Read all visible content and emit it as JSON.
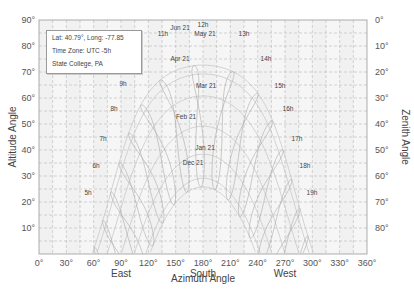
{
  "chart_data": {
    "type": "line",
    "title": "",
    "xlabel": "Azimuth Angle",
    "ylabel": "Altitude Angle",
    "y2label": "Zenith Angle",
    "xlim": [
      0,
      360
    ],
    "ylim": [
      0,
      90
    ],
    "grid": true,
    "x_ticks": [
      "0°",
      "30°",
      "60°",
      "90°",
      "120°",
      "150°",
      "180°",
      "210°",
      "240°",
      "270°",
      "300°",
      "330°",
      "360°"
    ],
    "x_direction_labels": [
      {
        "at": 90,
        "text": "East"
      },
      {
        "at": 180,
        "text": "South"
      },
      {
        "at": 270,
        "text": "West"
      }
    ],
    "y_ticks": [
      "10°",
      "20°",
      "30°",
      "40°",
      "50°",
      "60°",
      "70°",
      "80°",
      "90°"
    ],
    "y2_ticks": [
      "0°",
      "10°",
      "20°",
      "30°",
      "40°",
      "50°",
      "60°",
      "70°",
      "80°"
    ],
    "info": {
      "line1": "Lat: 40.79°, Long: -77.85",
      "line2": "Time Zone: UTC -5h",
      "line3": "State College, PA"
    },
    "location": {
      "lat": 40.79,
      "lon": -77.85,
      "tz": -5
    },
    "date_series": [
      {
        "name": "Jun 21",
        "doy": 172,
        "peak_altitude": 72.6
      },
      {
        "name": "May 21",
        "doy": 141,
        "peak_altitude": 69.3
      },
      {
        "name": "Apr 21",
        "doy": 111,
        "peak_altitude": 61.0
      },
      {
        "name": "Mar 21",
        "doy": 80,
        "peak_altitude": 49.2
      },
      {
        "name": "Feb 21",
        "doy": 52,
        "peak_altitude": 38.0
      },
      {
        "name": "Jan 21",
        "doy": 21,
        "peak_altitude": 29.2
      },
      {
        "name": "Dec 21",
        "doy": 355,
        "peak_altitude": 25.8
      }
    ],
    "hour_series": [
      "5h",
      "6h",
      "7h",
      "8h",
      "9h",
      "10h",
      "11h",
      "12h",
      "13h",
      "14h",
      "15h",
      "16h",
      "17h",
      "18h",
      "19h"
    ],
    "labels": [
      {
        "text": "Jun 21",
        "x": 180,
        "y": 30
      },
      {
        "text": "12h",
        "x": 203,
        "y": 27
      },
      {
        "text": "11h",
        "x": 163,
        "y": 36
      },
      {
        "text": "May 21",
        "x": 205,
        "y": 36
      },
      {
        "text": "13h",
        "x": 244,
        "y": 36
      },
      {
        "text": "10h",
        "x": 134,
        "y": 61
      },
      {
        "text": "Apr 21",
        "x": 180,
        "y": 61
      },
      {
        "text": "14h",
        "x": 266,
        "y": 61
      },
      {
        "text": "9h",
        "x": 123,
        "y": 86
      },
      {
        "text": "Mar 21",
        "x": 206,
        "y": 88
      },
      {
        "text": "15h",
        "x": 280,
        "y": 88
      },
      {
        "text": "8h",
        "x": 114,
        "y": 111
      },
      {
        "text": "16h",
        "x": 288,
        "y": 111
      },
      {
        "text": "Feb 21",
        "x": 186,
        "y": 119
      },
      {
        "text": "7h",
        "x": 103,
        "y": 141
      },
      {
        "text": "Jan 21",
        "x": 205,
        "y": 150
      },
      {
        "text": "17h",
        "x": 297,
        "y": 141
      },
      {
        "text": "Dec 21",
        "x": 193,
        "y": 165
      },
      {
        "text": "6h",
        "x": 96,
        "y": 168
      },
      {
        "text": "18h",
        "x": 305,
        "y": 168
      },
      {
        "text": "5h",
        "x": 88,
        "y": 195
      },
      {
        "text": "19h",
        "x": 312,
        "y": 195
      }
    ]
  }
}
